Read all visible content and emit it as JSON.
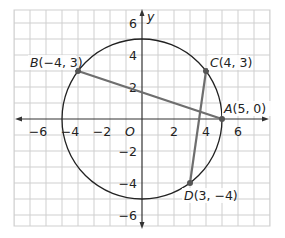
{
  "diagram": {
    "type": "coordinate-plane-circle",
    "axes": {
      "x_label": "",
      "y_label": "y",
      "origin_label": "O",
      "x_ticks": [
        {
          "value": -6,
          "label": "−6"
        },
        {
          "value": -4,
          "label": "−4"
        },
        {
          "value": -2,
          "label": "−2"
        },
        {
          "value": 2,
          "label": "2"
        },
        {
          "value": 4,
          "label": "4"
        },
        {
          "value": 6,
          "label": "6"
        }
      ],
      "y_ticks": [
        {
          "value": 6,
          "label": "6"
        },
        {
          "value": 4,
          "label": "4"
        },
        {
          "value": 2,
          "label": "2"
        },
        {
          "value": -2,
          "label": "−2"
        },
        {
          "value": -4,
          "label": "−4"
        },
        {
          "value": -6,
          "label": "−6"
        }
      ]
    },
    "circle": {
      "center": [
        0,
        0
      ],
      "radius": 5
    },
    "points": [
      {
        "name": "A",
        "coords": "(5, 0)",
        "x": 5,
        "y": 0
      },
      {
        "name": "B",
        "coords": "(−4, 3)",
        "x": -4,
        "y": 3
      },
      {
        "name": "C",
        "coords": "(4, 3)",
        "x": 4,
        "y": 3
      },
      {
        "name": "D",
        "coords": "(3, −4)",
        "x": 3,
        "y": -4
      }
    ],
    "segments": [
      {
        "from": "A",
        "to": "B"
      },
      {
        "from": "C",
        "to": "D"
      }
    ],
    "colors": {
      "grid": "#cfcfcf",
      "axis": "#333333",
      "circle": "#222222",
      "segment": "#6e6e6e",
      "point": "#555555"
    }
  }
}
